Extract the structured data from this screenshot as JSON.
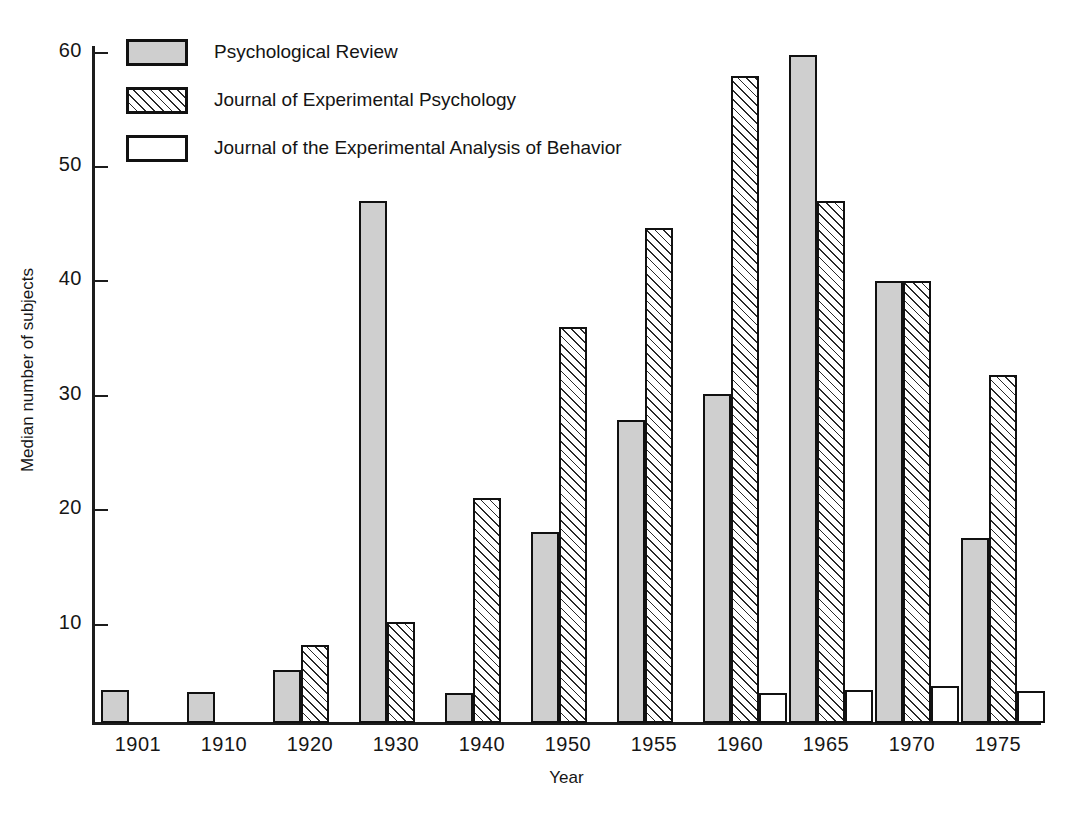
{
  "chart_data": {
    "type": "bar",
    "title": "",
    "xlabel": "Year",
    "ylabel": "Median number of subjects",
    "categories": [
      "1901",
      "1910",
      "1920",
      "1930",
      "1940",
      "1950",
      "1955",
      "1960",
      "1965",
      "1970",
      "1975"
    ],
    "ylim": [
      1.4,
      63
    ],
    "yticks": [
      10,
      20,
      30,
      40,
      50,
      60
    ],
    "ytick_labels": [
      "10",
      "20",
      "30",
      "40",
      "50",
      "60"
    ],
    "grid": false,
    "legend_position": "top-left",
    "series": [
      {
        "name": "Psychological Review",
        "fill": "solid-gray",
        "color": "#cfcfcf",
        "values": [
          4.3,
          4.1,
          6.0,
          47.0,
          4.0,
          18.1,
          27.9,
          30.2,
          59.8,
          40.0,
          17.6
        ]
      },
      {
        "name": "Journal of Experimental Psychology",
        "fill": "diagonal-hatch",
        "color": "#ffffff",
        "values": [
          null,
          null,
          8.2,
          10.2,
          21.1,
          36.0,
          44.7,
          58.0,
          47.0,
          40.0,
          31.8
        ]
      },
      {
        "name": "Journal of the Experimental Analysis of Behavior",
        "fill": "open-white",
        "color": "#ffffff",
        "values": [
          null,
          null,
          null,
          null,
          null,
          null,
          null,
          4.0,
          4.3,
          4.6,
          4.2
        ]
      }
    ]
  },
  "legend": {
    "items": [
      {
        "label": "Psychological Review",
        "fill": "solid"
      },
      {
        "label": "Journal of Experimental Psychology",
        "fill": "hatch"
      },
      {
        "label": "Journal of the Experimental Analysis of Behavior",
        "fill": "open"
      }
    ]
  },
  "axes": {
    "y_title": "Median number of subjects",
    "x_title": "Year"
  }
}
